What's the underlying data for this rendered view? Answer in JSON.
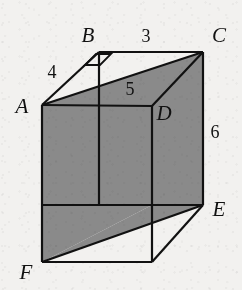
{
  "figure": {
    "background_color": "#f2f1ef",
    "fill_color": "#8a8a8a",
    "stroke_color": "#111111"
  },
  "vertices": [
    {
      "id": "A",
      "label": "A",
      "x": 42,
      "y": 105,
      "label_x": 22,
      "label_y": 113
    },
    {
      "id": "B",
      "label": "B",
      "x": 99,
      "y": 52,
      "label_x": 88,
      "label_y": 42
    },
    {
      "id": "C",
      "label": "C",
      "x": 203,
      "y": 52,
      "label_x": 216,
      "label_y": 42
    },
    {
      "id": "D",
      "label": "D",
      "x": 152,
      "y": 106,
      "label_x": 158,
      "label_y": 120
    },
    {
      "id": "E",
      "label": "E",
      "x": 203,
      "y": 205,
      "label_x": 215,
      "label_y": 214
    },
    {
      "id": "F",
      "label": "F",
      "x": 42,
      "y": 262,
      "label_x": 24,
      "label_y": 277
    }
  ],
  "measurements": [
    {
      "id": "AB",
      "value": "4",
      "x": 52,
      "y": 78,
      "edge": "A-B"
    },
    {
      "id": "BC",
      "value": "3",
      "x": 146,
      "y": 42,
      "edge": "B-C"
    },
    {
      "id": "AD",
      "value": "5",
      "x": 130,
      "y": 93,
      "edge": "A-D"
    },
    {
      "id": "CE",
      "value": "6",
      "x": 213,
      "y": 136,
      "edge": "C-E"
    }
  ],
  "markers": [
    {
      "id": "right-angle-at-B",
      "type": "right-angle",
      "at": "B"
    }
  ]
}
